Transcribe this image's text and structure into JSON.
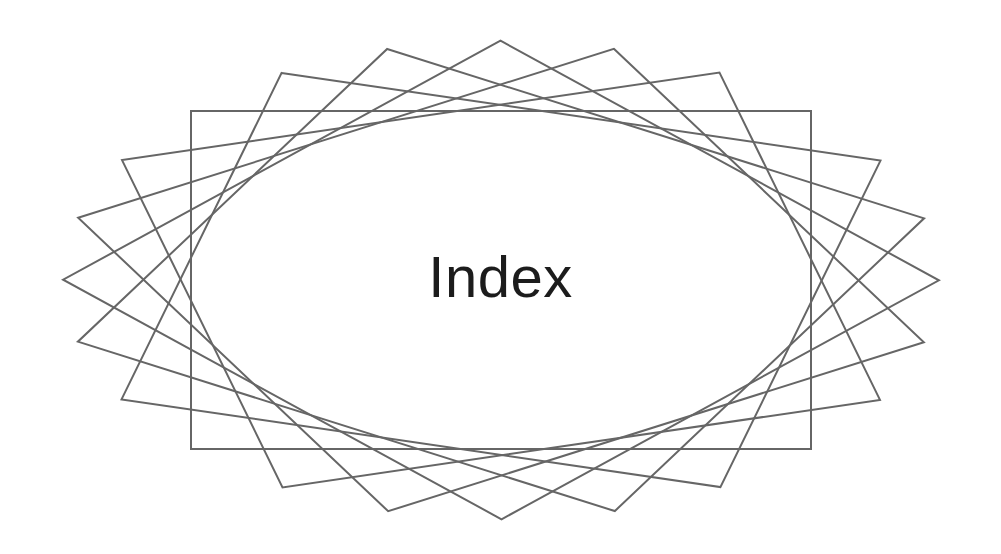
{
  "page": {
    "width": 1001,
    "height": 554,
    "background_color": "#ffffff"
  },
  "title": {
    "text": "Index",
    "color": "#1c1c1c",
    "font_size_px": 58,
    "center_x": 501,
    "center_y": 280
  },
  "chart_data": {
    "type": "line",
    "title": "Index",
    "subtitle": "",
    "xlabel": "",
    "ylabel": "",
    "grid": false,
    "legend_position": "none",
    "annotations": [
      "Index"
    ],
    "stroke_color": "#666666",
    "stroke_width_px": 2,
    "fill": "none",
    "center": {
      "x": 501,
      "y": 280
    },
    "base_rectangle": {
      "x_min": 190,
      "x_max": 810,
      "y_min": 111,
      "y_max": 450,
      "half_width": 310,
      "half_height": 169
    },
    "horizontal_stretch": 1.83,
    "rotation_count": 6,
    "rotation_step_deg": 15,
    "rotations_deg": [
      0,
      15,
      30,
      45,
      60,
      75
    ],
    "envelope": {
      "shape": "ellipse",
      "center_x": 501,
      "center_y": 280,
      "radius_x": 310,
      "radius_y": 169
    },
    "extents": {
      "left_x": 62,
      "right_x": 940,
      "top_y": 37,
      "bottom_y": 522
    },
    "series": [
      {
        "name": "rect-0",
        "rotation_deg": 0,
        "values": [
          190,
          111,
          810,
          111,
          810,
          450,
          190,
          450
        ]
      },
      {
        "name": "rect-15",
        "rotation_deg": 15,
        "values": [
          190,
          111,
          810,
          111,
          810,
          450,
          190,
          450
        ]
      },
      {
        "name": "rect-30",
        "rotation_deg": 30,
        "values": [
          190,
          111,
          810,
          111,
          810,
          450,
          190,
          450
        ]
      },
      {
        "name": "rect-45",
        "rotation_deg": 45,
        "values": [
          190,
          111,
          810,
          111,
          810,
          450,
          190,
          450
        ]
      },
      {
        "name": "rect-60",
        "rotation_deg": 60,
        "values": [
          190,
          111,
          810,
          111,
          810,
          450,
          190,
          450
        ]
      },
      {
        "name": "rect-75",
        "rotation_deg": 75,
        "values": [
          190,
          111,
          810,
          111,
          810,
          450,
          190,
          450
        ]
      }
    ]
  }
}
